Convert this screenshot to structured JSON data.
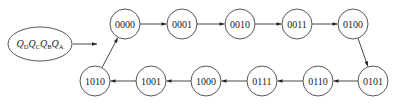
{
  "legend": {
    "label_parts": [
      {
        "base": "Q",
        "sub": "D"
      },
      {
        "base": "Q",
        "sub": "C"
      },
      {
        "base": "Q",
        "sub": "B"
      },
      {
        "base": "Q",
        "sub": "A"
      }
    ]
  },
  "states": [
    {
      "id": "s0",
      "label": "0000",
      "cx": 125,
      "cy": 24
    },
    {
      "id": "s1",
      "label": "0001",
      "cx": 182,
      "cy": 24
    },
    {
      "id": "s2",
      "label": "0010",
      "cx": 240,
      "cy": 24
    },
    {
      "id": "s3",
      "label": "0011",
      "cx": 297,
      "cy": 24
    },
    {
      "id": "s4",
      "label": "0100",
      "cx": 353,
      "cy": 24
    },
    {
      "id": "s5",
      "label": "0101",
      "cx": 373,
      "cy": 81
    },
    {
      "id": "s6",
      "label": "0110",
      "cx": 318,
      "cy": 81
    },
    {
      "id": "s7",
      "label": "0111",
      "cx": 262,
      "cy": 81
    },
    {
      "id": "s8",
      "label": "1000",
      "cx": 206,
      "cy": 81
    },
    {
      "id": "s9",
      "label": "1001",
      "cx": 151,
      "cy": 81
    },
    {
      "id": "s10",
      "label": "1010",
      "cx": 95,
      "cy": 81
    }
  ],
  "transitions": [
    "s0>s1",
    "s1>s2",
    "s2>s3",
    "s3>s4",
    "s4>s5",
    "s5>s6",
    "s6>s7",
    "s7>s8",
    "s8>s9",
    "s9>s10",
    "s10>s0"
  ]
}
